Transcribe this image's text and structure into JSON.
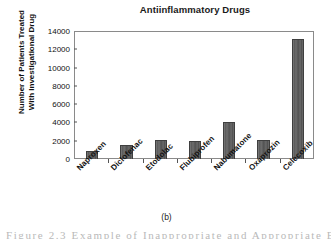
{
  "chart_data": {
    "type": "bar",
    "title": "Antiinflammatory Drugs",
    "xlabel": "",
    "ylabel": "Number of Patients Treated With Investigational Drug",
    "ylabel_lines": [
      "Number of Patients Treated",
      "With Investigational Drug"
    ],
    "categories": [
      "Naproxen",
      "Diclofenac",
      "Etodolac",
      "Flubiprofen",
      "Nabumatone",
      "Oxaprozin",
      "Celecoxib"
    ],
    "values": [
      900,
      1500,
      2100,
      1950,
      4100,
      2100,
      13100
    ],
    "ylim": [
      0,
      14000
    ],
    "ytick_step": 2000,
    "yticks": [
      0,
      2000,
      4000,
      6000,
      8000,
      10000,
      12000,
      14000
    ],
    "ytick_labels": [
      "0",
      "2000",
      "4000",
      "6000",
      "8000",
      "10000",
      "12000",
      "14000"
    ],
    "grid": false,
    "legend": false,
    "legend_position": "none",
    "bar_color": "#5c5c5c",
    "bar_edge_color": "#3f3f3f",
    "axis_color": "#8a8a8a",
    "background_color": "#ffffff"
  },
  "caption": {
    "panel_label": "(b)",
    "figure_text_fragment": "Figure 2.3    Example of Inappropriate and Appropriate Bar..."
  }
}
